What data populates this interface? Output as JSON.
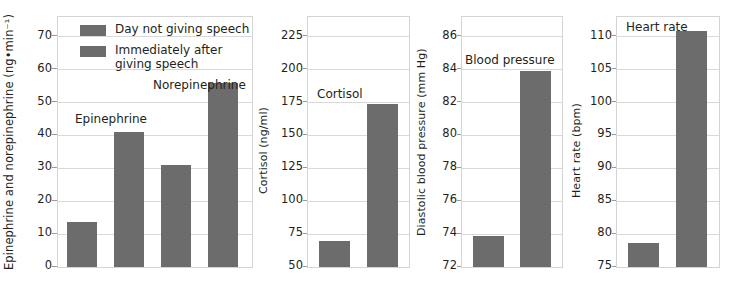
{
  "figure": {
    "legend": {
      "entries": [
        {
          "label": "Day not giving speech",
          "color": "#6c6c6c"
        },
        {
          "label": "Immediately after\ngiving speech",
          "color": "#6c6c6c"
        }
      ]
    }
  },
  "chart_data": [
    {
      "type": "bar",
      "title": "",
      "panel_id": "catecholamines",
      "ylabel": "Epinephrine and norepinephrine (ng•min⁻¹)",
      "xlabel": "",
      "ylim": [
        0,
        76
      ],
      "yticks": [
        0,
        10,
        20,
        30,
        40,
        50,
        60,
        70
      ],
      "ytick_labels": [
        "0",
        "10",
        "20",
        "30",
        "40",
        "50",
        "60",
        "70"
      ],
      "grid": true,
      "group_labels": [
        "Epinephrine",
        "Norepinephrine"
      ],
      "categories": [
        "Day not giving speech",
        "Immediately after giving speech"
      ],
      "series": [
        {
          "name": "Epinephrine",
          "values": [
            13.7,
            41.0
          ]
        },
        {
          "name": "Norepinephrine",
          "values": [
            31.0,
            55.8
          ]
        }
      ]
    },
    {
      "type": "bar",
      "title": "Cortisol",
      "panel_id": "cortisol",
      "ylabel": "Cortisol (ng/ml)",
      "xlabel": "",
      "ylim": [
        50,
        240
      ],
      "yticks": [
        50,
        75,
        100,
        125,
        150,
        175,
        200,
        225
      ],
      "ytick_labels": [
        "50",
        "75",
        "100",
        "125",
        "150",
        "175",
        "200",
        "225"
      ],
      "grid": true,
      "categories": [
        "Day not giving speech",
        "Immediately after giving speech"
      ],
      "values": [
        70.0,
        174.0
      ]
    },
    {
      "type": "bar",
      "title": "Blood pressure",
      "panel_id": "blood-pressure",
      "ylabel": "Diastolic blood pressure (mm Hg)",
      "xlabel": "",
      "ylim": [
        72,
        87.2
      ],
      "yticks": [
        72,
        74,
        76,
        78,
        80,
        82,
        84,
        86
      ],
      "ytick_labels": [
        "72",
        "74",
        "76",
        "78",
        "80",
        "82",
        "84",
        "86"
      ],
      "grid": true,
      "categories": [
        "Day not giving speech",
        "Immediately after giving speech"
      ],
      "values": [
        73.9,
        83.9
      ]
    },
    {
      "type": "bar",
      "title": "Heart rate",
      "panel_id": "heart-rate",
      "ylabel": "Heart rate (bpm)",
      "xlabel": "",
      "ylim": [
        75,
        113
      ],
      "yticks": [
        75,
        80,
        85,
        90,
        95,
        100,
        105,
        110
      ],
      "ytick_labels": [
        "75",
        "80",
        "85",
        "90",
        "95",
        "100",
        "105",
        "110"
      ],
      "grid": true,
      "categories": [
        "Day not giving speech",
        "Immediately after giving speech"
      ],
      "values": [
        78.7,
        110.8
      ]
    }
  ]
}
